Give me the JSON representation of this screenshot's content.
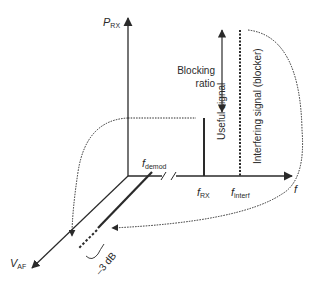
{
  "figure": {
    "axes": {
      "y_axis": {
        "symbol": "P",
        "subscript": "RX"
      },
      "x_axis": {
        "symbol": "f",
        "subscript": ""
      },
      "z_axis": {
        "symbol": "V",
        "subscript": "AF"
      }
    },
    "frequency_labels": {
      "demod": {
        "symbol": "f",
        "subscript": "demod"
      },
      "rx": {
        "symbol": "f",
        "subscript": "RX"
      },
      "interf": {
        "symbol": "f",
        "subscript": "interf"
      }
    },
    "signals": {
      "useful": "Useful signal",
      "interfering": "Interfering signal (blocker)"
    },
    "annotations": {
      "blocking_line1": "Blocking",
      "blocking_line2": "ratio",
      "attenuation": "–3 dB"
    },
    "colors": {
      "line": "#2a2a2a",
      "background": "#ffffff"
    }
  }
}
